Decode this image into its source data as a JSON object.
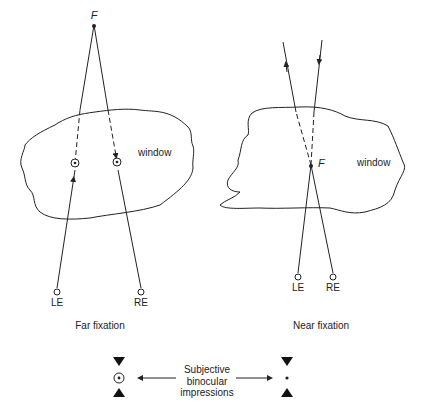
{
  "far_panel": {
    "fixation_label": "F",
    "window_label": "window",
    "left_eye_label": "LE",
    "right_eye_label": "RE",
    "caption": "Far fixation"
  },
  "near_panel": {
    "fixation_label": "F",
    "window_label": "window",
    "left_eye_label": "LE",
    "right_eye_label": "RE",
    "caption": "Near fixation"
  },
  "legend": {
    "line1": "Subjective",
    "line2": "binocular",
    "line3": "impressions"
  },
  "colors": {
    "stroke": "#222222",
    "background": "#ffffff"
  }
}
